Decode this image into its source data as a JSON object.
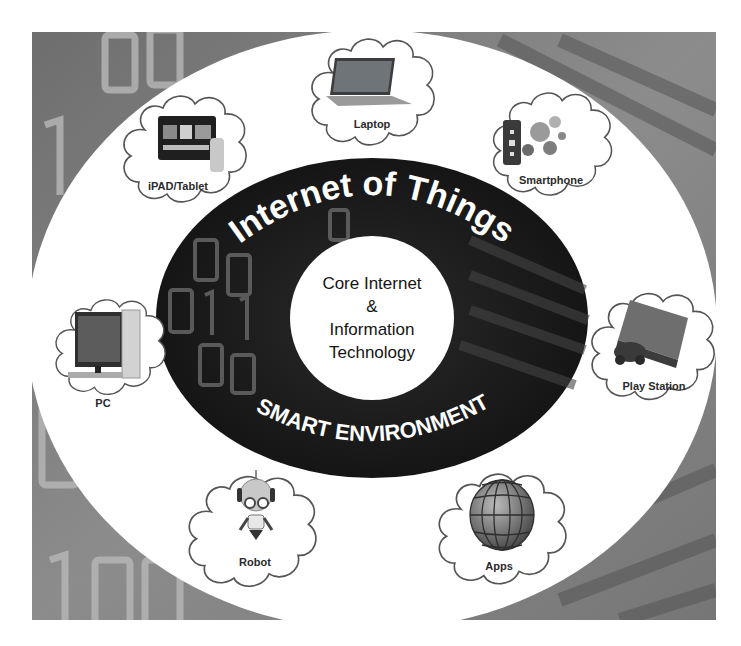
{
  "diagram": {
    "title_arc": "Internet of Things",
    "bottom_arc": "SMART ENVIRONMENT",
    "core": {
      "lines": [
        "Core Internet",
        "&",
        "Information",
        "Technology"
      ]
    },
    "devices": [
      {
        "id": "laptop",
        "label": "Laptop",
        "icon": "laptop-icon"
      },
      {
        "id": "ipad",
        "label": "iPAD/Tablet",
        "icon": "tablet-icon"
      },
      {
        "id": "smartphone",
        "label": "Smartphone",
        "icon": "smartphone-icon"
      },
      {
        "id": "pc",
        "label": "PC",
        "icon": "desktop-pc-icon"
      },
      {
        "id": "playstation",
        "label": "Play Station",
        "icon": "game-console-icon"
      },
      {
        "id": "robot",
        "label": "Robot",
        "icon": "robot-icon"
      },
      {
        "id": "apps",
        "label": "Apps",
        "icon": "globe-icon"
      }
    ],
    "colors": {
      "background_photo": "#8a8a8a",
      "outer_ring": "#ffffff",
      "inner_ring": "#1c1c1c",
      "core_circle": "#ffffff",
      "cloud_stroke": "#555555",
      "arc_text": "#ffffff"
    }
  }
}
